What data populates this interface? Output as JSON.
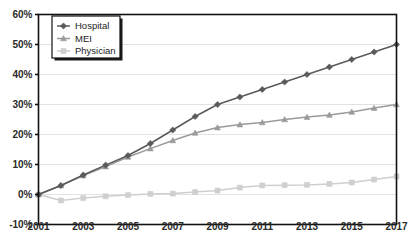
{
  "chart_data": {
    "type": "line",
    "title": "",
    "subtitle": "",
    "xlabel": "",
    "ylabel": "",
    "x": [
      2001,
      2002,
      2003,
      2004,
      2005,
      2006,
      2007,
      2008,
      2009,
      2010,
      2011,
      2012,
      2013,
      2014,
      2015,
      2016,
      2017
    ],
    "xlim": [
      2001,
      2017
    ],
    "ylim": [
      -10,
      60
    ],
    "yticks": [
      -10,
      0,
      10,
      20,
      30,
      40,
      50,
      60
    ],
    "ytick_labels": [
      "-10%",
      "0%",
      "10%",
      "20%",
      "30%",
      "40%",
      "50%",
      "60%"
    ],
    "xticks": [
      2001,
      2003,
      2005,
      2007,
      2009,
      2011,
      2013,
      2015,
      2017
    ],
    "xtick_labels": [
      "2001",
      "2003",
      "2005",
      "2007",
      "2009",
      "2011",
      "2013",
      "2015",
      "2017"
    ],
    "grid": true,
    "grid_axis": "y",
    "legend_position": "top-left",
    "series": [
      {
        "name": "Hospital",
        "color": "#5a5a5a",
        "marker": "diamond",
        "values": [
          0.0,
          3.0,
          6.5,
          9.8,
          13.0,
          17.0,
          21.5,
          26.0,
          30.0,
          32.5,
          35.0,
          37.5,
          40.0,
          42.5,
          45.0,
          47.5,
          50.0
        ]
      },
      {
        "name": "MEI",
        "color": "#9a9a9a",
        "marker": "triangle",
        "values": [
          0.0,
          3.0,
          6.3,
          9.3,
          12.5,
          15.3,
          18.0,
          20.5,
          22.3,
          23.3,
          24.0,
          25.0,
          25.8,
          26.5,
          27.5,
          28.8,
          30.0
        ]
      },
      {
        "name": "Physician",
        "color": "#cfcfcf",
        "marker": "square",
        "values": [
          0.0,
          -2.0,
          -1.2,
          -0.6,
          -0.2,
          0.2,
          0.3,
          0.8,
          1.3,
          2.3,
          3.0,
          3.1,
          3.2,
          3.5,
          4.0,
          5.0,
          6.0
        ]
      }
    ]
  },
  "legend": {
    "items": [
      {
        "label": "Hospital"
      },
      {
        "label": "MEI"
      },
      {
        "label": "Physician"
      }
    ]
  }
}
